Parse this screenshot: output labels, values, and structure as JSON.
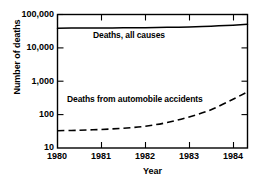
{
  "chart_data": {
    "type": "line",
    "title": "",
    "xlabel": "Year",
    "ylabel": "Number of deaths",
    "xlim": [
      1980,
      1984.33
    ],
    "ylim": [
      10,
      100000
    ],
    "yscale": "log",
    "xscale": "linear",
    "grid": false,
    "legend_position": "inline-annotation",
    "xticks": [
      1980,
      1981,
      1982,
      1983,
      1984
    ],
    "xticklabels": [
      "1980",
      "1981",
      "1982",
      "1983",
      "1984"
    ],
    "yticks": [
      10,
      100,
      1000,
      10000,
      100000
    ],
    "yticklabels": [
      "10",
      "100",
      "1,000",
      "10,000",
      "100,000"
    ],
    "series": [
      {
        "name": "Deaths, all causes",
        "style": "solid",
        "color": "#000000",
        "x": [
          1980,
          1980.5,
          1981,
          1981.5,
          1982,
          1982.5,
          1983,
          1983.5,
          1984,
          1984.33
        ],
        "values": [
          39000,
          39200,
          39500,
          39900,
          40400,
          41200,
          42500,
          44600,
          48000,
          51000
        ]
      },
      {
        "name": "Deaths from automobile accidents",
        "style": "dashed",
        "color": "#000000",
        "x": [
          1980,
          1980.5,
          1981,
          1981.5,
          1982,
          1982.5,
          1983,
          1983.5,
          1984,
          1984.33
        ],
        "values": [
          33,
          34,
          36,
          39,
          45,
          58,
          85,
          140,
          290,
          480
        ]
      }
    ],
    "annotations": [
      {
        "text": "Deaths, all causes",
        "x": 1982.1,
        "y": 17000
      },
      {
        "text": "Deaths from automobile accidents",
        "x": 1981.5,
        "y": 430
      }
    ]
  }
}
